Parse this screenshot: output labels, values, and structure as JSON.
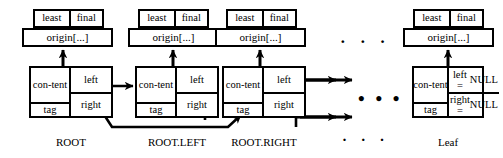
{
  "diagram": {
    "colors": {
      "stroke": "#000000",
      "background": "#ffffff"
    },
    "labels": {
      "least": "least",
      "final": "final",
      "origin": "origin[...]",
      "content": "con-",
      "content2": "tent",
      "tag": "tag",
      "left": "left",
      "right": "right",
      "left_null_1": "left =",
      "left_null_2": "NULL",
      "right_null_1": "right =",
      "right_null_2": "NULL",
      "ellipsis": "· · ·",
      "ellipsis_bold": "• • •"
    },
    "nodes": [
      {
        "id": "root",
        "caption": "ROOT",
        "header": {
          "left": "least",
          "right": "final"
        },
        "origin": "origin[...]",
        "fields": {
          "content": "con-tent",
          "tag": "tag",
          "left": "left",
          "right": "right"
        }
      },
      {
        "id": "root-left",
        "caption": "ROOT.LEFT",
        "header": {
          "left": "least",
          "right": "final"
        },
        "origin": "origin[...]",
        "fields": {
          "content": "con-tent",
          "tag": "tag",
          "left": "left",
          "right": "right"
        }
      },
      {
        "id": "root-right",
        "caption": "ROOT.RIGHT",
        "header": {
          "left": "least",
          "right": "final"
        },
        "origin": "origin[...]",
        "fields": {
          "content": "con-tent",
          "tag": "tag",
          "left": "left",
          "right": "right"
        }
      },
      {
        "id": "leaf",
        "caption": "Leaf",
        "header": {
          "left": "least",
          "right": "final"
        },
        "origin": "origin[...]",
        "fields": {
          "content": "con-tent",
          "tag": "tag",
          "left_line1": "left =",
          "left_line2": "NULL",
          "right_line1": "right =",
          "right_line2": "NULL"
        }
      }
    ],
    "ellipses": {
      "top": "· · ·",
      "middle": "• • •",
      "bottom": "· · ·"
    }
  }
}
